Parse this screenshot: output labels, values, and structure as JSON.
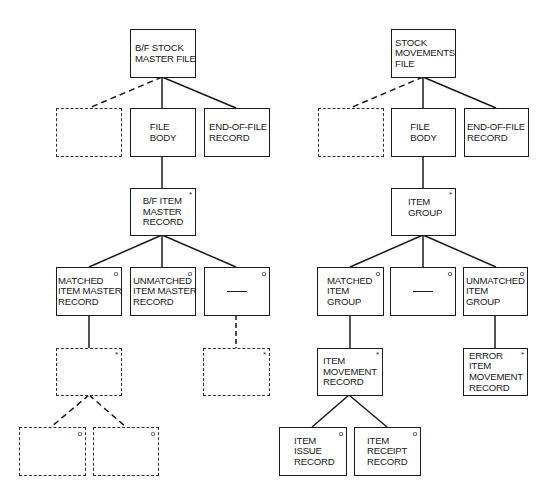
{
  "diagram": {
    "type": "Jackson structure diagrams",
    "legend": {
      "iteration_marker": "*",
      "selection_marker": "o"
    },
    "trees": [
      {
        "name": "B/F stock master file",
        "nodes": {
          "root": {
            "label": "B/F STOCK\nMASTER FILE",
            "marker": ""
          },
          "l2_empty": {
            "label": "",
            "marker": "",
            "style": "dashed"
          },
          "l2_body": {
            "label": "FILE\nBODY",
            "marker": ""
          },
          "l2_eof": {
            "label": "END-OF-FILE\nRECORD",
            "marker": ""
          },
          "l3": {
            "label": "B/F ITEM\nMASTER\nRECORD",
            "marker": "*"
          },
          "l4_matched": {
            "label": "MATCHED\nITEM MASTER\nRECORD",
            "marker": "o"
          },
          "l4_unmatched": {
            "label": "UNMATCHED\nITEM MASTER\nRECORD",
            "marker": "o"
          },
          "l4_null": {
            "label": "—",
            "marker": "o"
          },
          "l5_left": {
            "label": "",
            "marker": "*",
            "style": "dashed"
          },
          "l5_right": {
            "label": "",
            "marker": "*",
            "style": "dashed"
          },
          "l6_a": {
            "label": "",
            "marker": "o",
            "style": "dashed"
          },
          "l6_b": {
            "label": "",
            "marker": "o",
            "style": "dashed"
          }
        }
      },
      {
        "name": "Stock movements file",
        "nodes": {
          "root": {
            "label": "STOCK\nMOVEMENTS\nFILE",
            "marker": ""
          },
          "l2_empty": {
            "label": "",
            "marker": "",
            "style": "dashed"
          },
          "l2_body": {
            "label": "FILE\nBODY",
            "marker": ""
          },
          "l2_eof": {
            "label": "END-OF-FILE\nRECORD",
            "marker": ""
          },
          "l3": {
            "label": "ITEM\nGROUP",
            "marker": "*"
          },
          "l4_matched": {
            "label": "MATCHED\nITEM\nGROUP",
            "marker": "o"
          },
          "l4_null": {
            "label": "—",
            "marker": "o"
          },
          "l4_unmatched": {
            "label": "UNMATCHED\nITEM\nGROUP",
            "marker": "o"
          },
          "l5_movement": {
            "label": "ITEM\nMOVEMENT\nRECORD",
            "marker": "*"
          },
          "l5_error": {
            "label": "ERROR\nITEM\nMOVEMENT\nRECORD",
            "marker": "*"
          },
          "l6_issue": {
            "label": "ITEM\nISSUE\nRECORD",
            "marker": "o"
          },
          "l6_receipt": {
            "label": "ITEM\nRECEIPT\nRECORD",
            "marker": "o"
          }
        }
      }
    ]
  }
}
